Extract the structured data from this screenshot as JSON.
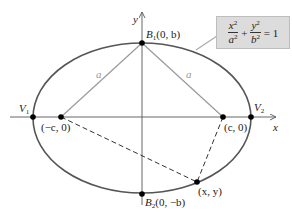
{
  "diagram": {
    "type": "ellipse-foci",
    "colors": {
      "ellipse": "#555555",
      "axes": "#666666",
      "focal_lines": "#9a9a9a",
      "dashed_lines": "#333333",
      "points": "#000000",
      "formula_bg": "#dcdcdc"
    },
    "axes": {
      "x_label": "x",
      "y_label": "y"
    },
    "points": {
      "V1": {
        "label_main": "V",
        "label_sub": "1"
      },
      "V2": {
        "label_main": "V",
        "label_sub": "2"
      },
      "B1": {
        "label_main": "B",
        "label_sub": "1",
        "label_coords": "(0, b)"
      },
      "B2": {
        "label_main": "B",
        "label_sub": "2",
        "label_coords": "(0, −b)"
      },
      "F1": {
        "label": "(−c, 0)"
      },
      "F2": {
        "label": "(c, 0)"
      },
      "P": {
        "label": "(x, y)"
      }
    },
    "segment_labels": {
      "left_a": "a",
      "right_a": "a"
    },
    "formula": {
      "term1_num": "x",
      "term1_den": "a",
      "term2_num": "y",
      "term2_den": "b",
      "exponent": "2",
      "plus": "+",
      "equals": "= 1"
    }
  }
}
